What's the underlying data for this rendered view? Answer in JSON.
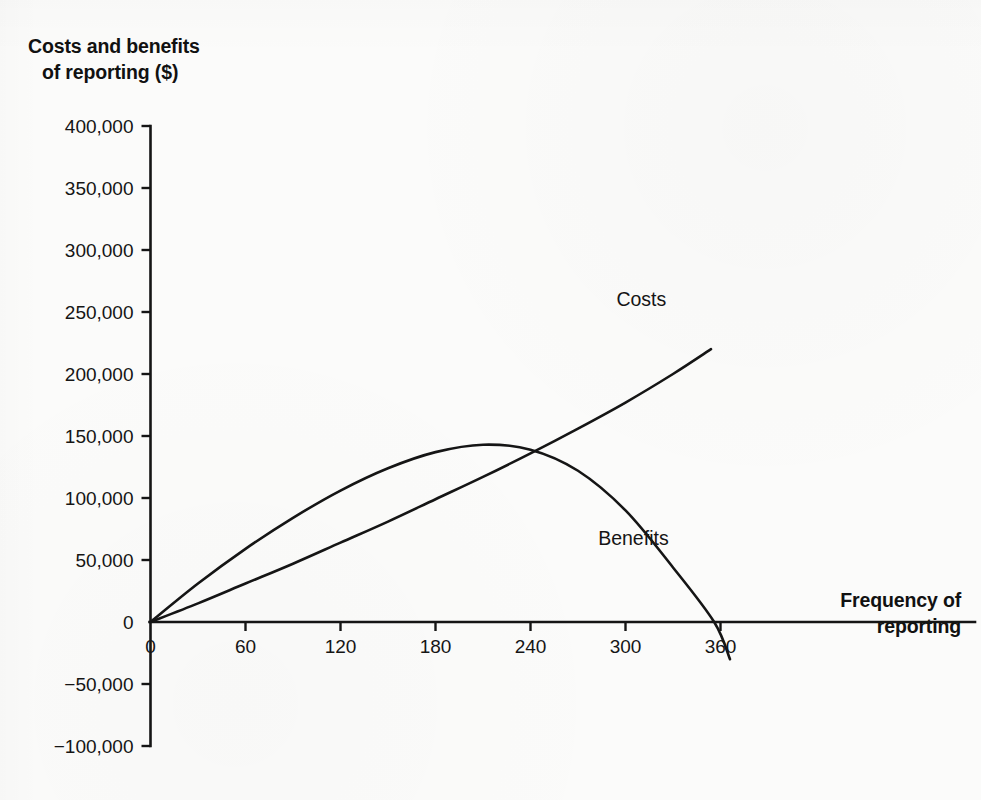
{
  "figure": {
    "y_axis_title_line1": "Costs and benefits",
    "y_axis_title_line2": "of reporting ($)",
    "x_axis_title_line1": "Frequency of",
    "x_axis_title_line2": "reporting"
  },
  "ghost_text": {
    "top_bleed": "",
    "right_block_1": "",
    "right_block_2": ""
  },
  "chart_data": {
    "type": "line",
    "title": "",
    "xlabel": "Frequency of reporting",
    "ylabel": "Costs and benefits of reporting ($)",
    "xlim": [
      0,
      375
    ],
    "ylim": [
      -100000,
      400000
    ],
    "xticks": [
      0,
      60,
      120,
      180,
      240,
      300,
      360
    ],
    "xtick_labels": [
      "0",
      "60",
      "120",
      "180",
      "240",
      "300",
      "360"
    ],
    "yticks": [
      -100000,
      -50000,
      0,
      50000,
      100000,
      150000,
      200000,
      250000,
      300000,
      350000,
      400000
    ],
    "ytick_labels": [
      "−100,000",
      "−50,000",
      "0",
      "50,000",
      "100,000",
      "150,000",
      "200,000",
      "250,000",
      "300,000",
      "350,000",
      "400,000"
    ],
    "grid": false,
    "legend": "inline-labels",
    "annotations": [
      {
        "text": "Costs",
        "x": 310,
        "y": 255000
      },
      {
        "text": "Benefits",
        "x": 305,
        "y": 62000
      }
    ],
    "series": [
      {
        "name": "Costs",
        "label": "Costs",
        "shape": "slightly-convex-increasing",
        "x": [
          0,
          30,
          60,
          90,
          120,
          150,
          180,
          210,
          240,
          270,
          300,
          330,
          354
        ],
        "values": [
          0,
          15000,
          31000,
          47000,
          64000,
          81000,
          99000,
          117000,
          136000,
          156000,
          177000,
          200000,
          220000
        ]
      },
      {
        "name": "Benefits",
        "label": "Benefits",
        "shape": "concave-parabola-peak-then-falls-below-zero",
        "x": [
          0,
          30,
          60,
          90,
          120,
          150,
          180,
          210,
          240,
          270,
          300,
          330,
          356,
          366
        ],
        "values": [
          0,
          31000,
          59000,
          84000,
          106000,
          124000,
          137000,
          143000,
          139000,
          122000,
          90000,
          44000,
          0,
          -30000
        ]
      }
    ],
    "key_points": {
      "benefits_peak": {
        "x": 208,
        "y": 143000
      },
      "intersection": {
        "x": 240,
        "y": 136000
      },
      "benefits_zero_crossing": {
        "x": 356,
        "y": 0
      },
      "origin": {
        "x": 0,
        "y": 0
      }
    }
  }
}
